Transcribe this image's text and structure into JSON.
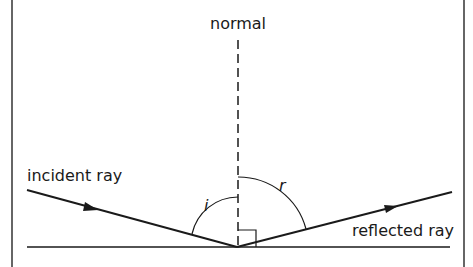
{
  "diagram": {
    "labels": {
      "normal": "normal",
      "incident_ray": "incident ray",
      "reflected_ray": "reflected ray",
      "angle_incidence": "i",
      "angle_reflection": "r"
    },
    "colors": {
      "line": "#1a1a1a",
      "background": "#ffffff"
    },
    "geometry": {
      "point_of_incidence": [
        237,
        247
      ],
      "normal_line": {
        "x": 238,
        "y_top": 40,
        "y_bottom": 247,
        "style": "dashed"
      },
      "mirror_surface": {
        "x1": 27,
        "x2": 450,
        "y": 247
      },
      "incident_ray": {
        "from": [
          27,
          190
        ],
        "to": [
          237,
          247
        ],
        "arrow_at": [
          92,
          208
        ]
      },
      "reflected_ray": {
        "from": [
          237,
          247
        ],
        "to": [
          452,
          192
        ],
        "arrow_at": [
          392,
          208
        ]
      },
      "right_angle_marker": {
        "x": 238,
        "y": 230,
        "size": 17
      }
    }
  }
}
